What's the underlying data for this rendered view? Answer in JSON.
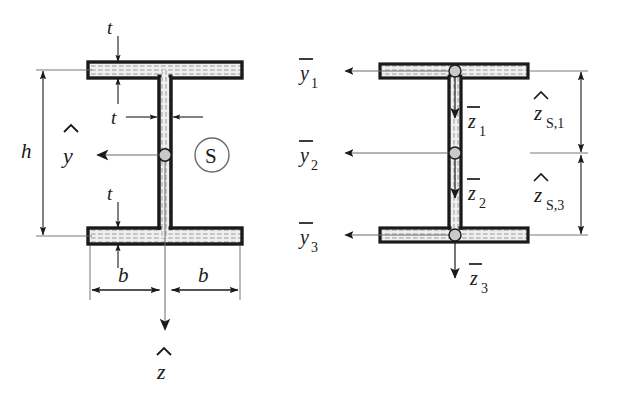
{
  "figure": {
    "background_color": "#ffffff",
    "line_color": "#1a1a1a",
    "section_fill_color": "#e8e8e8",
    "hatch_color": "#9a9a9a"
  },
  "left_figure": {
    "name": "cross-section-with-centroid-axes",
    "labels": {
      "flange_thickness_top": "t",
      "web_thickness": "t",
      "flange_thickness_bottom": "t",
      "height": "h",
      "half_width_left": "b",
      "half_width_right": "b",
      "axis_y": "y",
      "axis_y_accent": "hat",
      "axis_z": "z",
      "axis_z_accent": "hat",
      "shear_center": "S"
    }
  },
  "right_figure": {
    "name": "cross-section-with-partial-area-axes",
    "labels": {
      "y_bar_1": "y",
      "y_bar_1_sub": "1",
      "y_bar_2": "y",
      "y_bar_2_sub": "2",
      "y_bar_3": "y",
      "y_bar_3_sub": "3",
      "z_bar_1": "z",
      "z_bar_1_sub": "1",
      "z_bar_2": "z",
      "z_bar_2_sub": "2",
      "z_bar_3": "z",
      "z_bar_3_sub": "3",
      "z_hat_s1": "z",
      "z_hat_s1_sub": "S,1",
      "z_hat_s3": "z",
      "z_hat_s3_sub": "S,3"
    }
  }
}
